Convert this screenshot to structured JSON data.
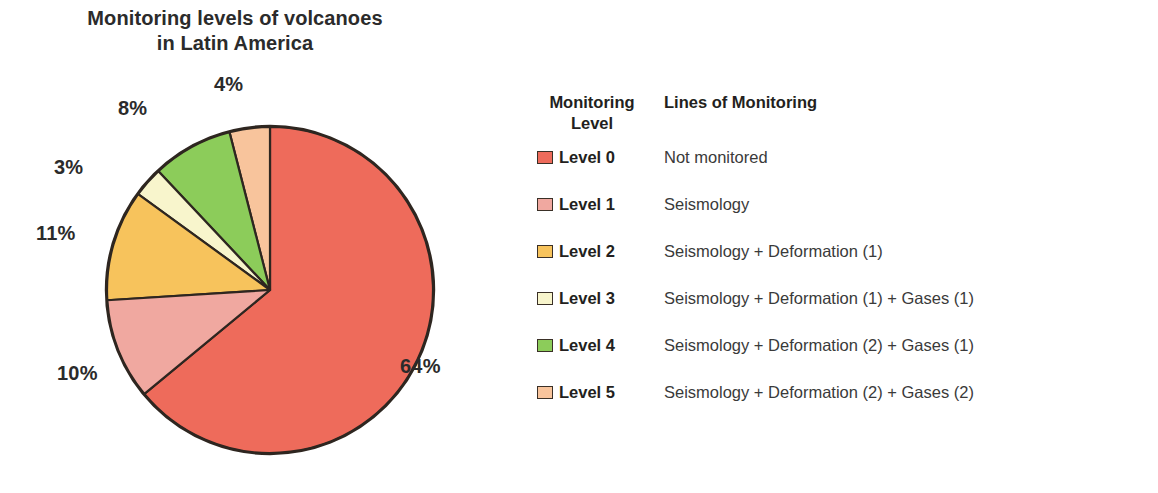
{
  "chart_data": {
    "type": "pie",
    "title": "Monitoring levels of volcanoes in Latin America",
    "title_line1": "Monitoring levels of volcanoes",
    "title_line2": "in Latin America",
    "xlabel": "",
    "ylabel": "",
    "legend_position": "right",
    "grid": false,
    "categories": [
      "Level 0",
      "Level 1",
      "Level 2",
      "Level 3",
      "Level 4",
      "Level 5"
    ],
    "values": [
      64,
      10,
      11,
      3,
      8,
      4
    ],
    "value_labels": [
      "64%",
      "10%",
      "11%",
      "3%",
      "8%",
      "4%"
    ],
    "colors": [
      "#ee6b5b",
      "#f0a8a0",
      "#f7c35c",
      "#f8f5cc",
      "#8ccc5a",
      "#f8c49c"
    ],
    "start_angle_deg": 0,
    "direction": "clockwise",
    "slices": [
      {
        "label": "Level 0",
        "value": 64,
        "value_label": "64%",
        "color": "#ee6b5b",
        "description": "Not monitored"
      },
      {
        "label": "Level 1",
        "value": 10,
        "value_label": "10%",
        "color": "#f0a8a0",
        "description": "Seismology"
      },
      {
        "label": "Level 2",
        "value": 11,
        "value_label": "11%",
        "color": "#f7c35c",
        "description": "Seismology + Deformation (1)"
      },
      {
        "label": "Level 3",
        "value": 3,
        "value_label": "3%",
        "color": "#f8f5cc",
        "description": "Seismology + Deformation (1) + Gases (1)"
      },
      {
        "label": "Level 4",
        "value": 8,
        "value_label": "8%",
        "color": "#8ccc5a",
        "description": "Seismology + Deformation (2) + Gases (1)"
      },
      {
        "label": "Level 5",
        "value": 4,
        "value_label": "4%",
        "color": "#f8c49c",
        "description": "Seismology + Deformation (2) + Gases (2)"
      }
    ]
  },
  "title": {
    "line1": "Monitoring levels of volcanoes",
    "line2": "in Latin America"
  },
  "pie": {
    "labels": {
      "level0": "64%",
      "level1": "10%",
      "level2": "11%",
      "level3": "3%",
      "level4": "8%",
      "level5": "4%"
    }
  },
  "legend": {
    "header": {
      "level_line1": "Monitoring",
      "level_line2": "Level",
      "lines": "Lines of Monitoring"
    },
    "rows": [
      {
        "label": "Level 0",
        "description": "Not monitored",
        "color": "#ee6b5b"
      },
      {
        "label": "Level 1",
        "description": "Seismology",
        "color": "#f0a8a0"
      },
      {
        "label": "Level 2",
        "description": "Seismology + Deformation (1)",
        "color": "#f7c35c"
      },
      {
        "label": "Level 3",
        "description": "Seismology + Deformation (1) + Gases (1)",
        "color": "#f8f5cc"
      },
      {
        "label": "Level 4",
        "description": "Seismology + Deformation (2) + Gases (1)",
        "color": "#8ccc5a"
      },
      {
        "label": "Level 5",
        "description": "Seismology + Deformation (2) + Gases (2)",
        "color": "#f8c49c"
      }
    ]
  }
}
